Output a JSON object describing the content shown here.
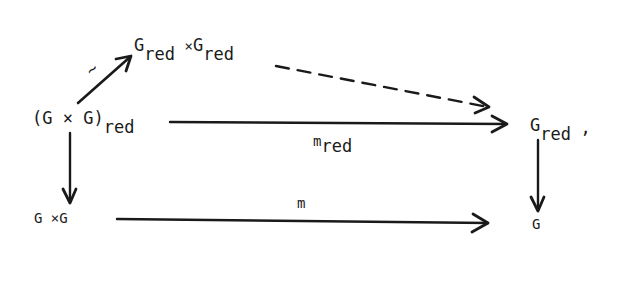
{
  "diagram": {
    "type": "commutative-diagram",
    "nodes": {
      "top": {
        "base1": "G",
        "sub1": "red",
        "times": "×",
        "base2": "G",
        "sub2": "red"
      },
      "left": {
        "main": "(G × G)",
        "sub": "red"
      },
      "right_top": {
        "base": "G",
        "sub": "red",
        "punct": ","
      },
      "bottom_left": {
        "main": "G ×G"
      },
      "bottom_right": {
        "main": "G"
      }
    },
    "arrows": {
      "diag": {
        "label": "~",
        "style": "solid"
      },
      "dashed": {
        "label": "",
        "style": "dashed"
      },
      "m_red": {
        "base": "m",
        "sub": "red",
        "style": "solid"
      },
      "m": {
        "label": "m",
        "style": "solid"
      },
      "left_down": {
        "style": "solid"
      },
      "right_down": {
        "style": "solid"
      }
    },
    "ink_color": "#1a1a1a"
  }
}
